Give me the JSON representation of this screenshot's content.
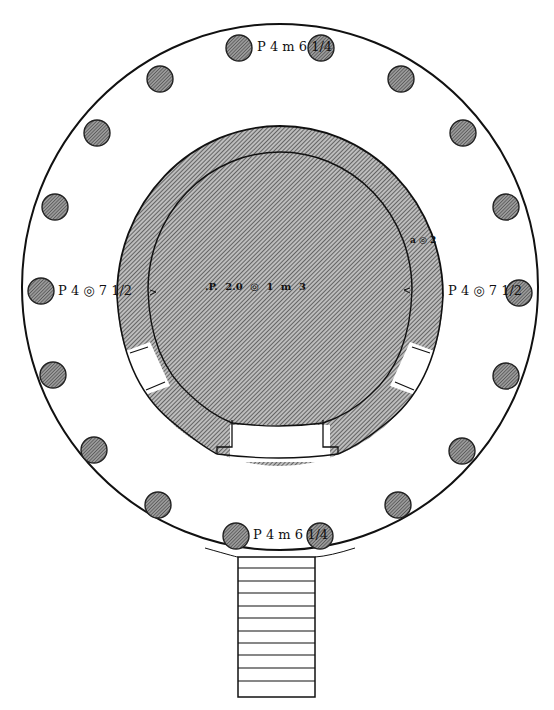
{
  "figure": {
    "type": "architectural-floor-plan",
    "colors": {
      "ink": "#111111",
      "hatch_fill": "#8a8a8a",
      "column_fill": "#6e6e6e",
      "paper": "#ffffff"
    }
  },
  "labels": {
    "top_dimension": "P 4  m 6 1/4",
    "left_dimension": "P 4 ◎ 7 1/2",
    "right_dimension": "P 4 ◎ 7 1/2",
    "bottom_dimension": "P 4  m 6 1/4",
    "center_dimension": ".P.    2.0   ◎  1   m   3",
    "wall_annotation": "a ◎ 2"
  },
  "columns": {
    "count": 16,
    "positions": [
      [
        239,
        48
      ],
      [
        321,
        48
      ],
      [
        160,
        79
      ],
      [
        401,
        79
      ],
      [
        97,
        133
      ],
      [
        463,
        133
      ],
      [
        55,
        207
      ],
      [
        506,
        207
      ],
      [
        41,
        291
      ],
      [
        519,
        293
      ],
      [
        52,
        375
      ],
      [
        506,
        375
      ],
      [
        94,
        450
      ],
      [
        462,
        451
      ],
      [
        158,
        505
      ],
      [
        398,
        505
      ],
      [
        236,
        536
      ],
      [
        320,
        536
      ]
    ],
    "radius": 13
  },
  "stair": {
    "steps": 12,
    "x": 238,
    "y": 557,
    "width": 77,
    "height": 140
  }
}
